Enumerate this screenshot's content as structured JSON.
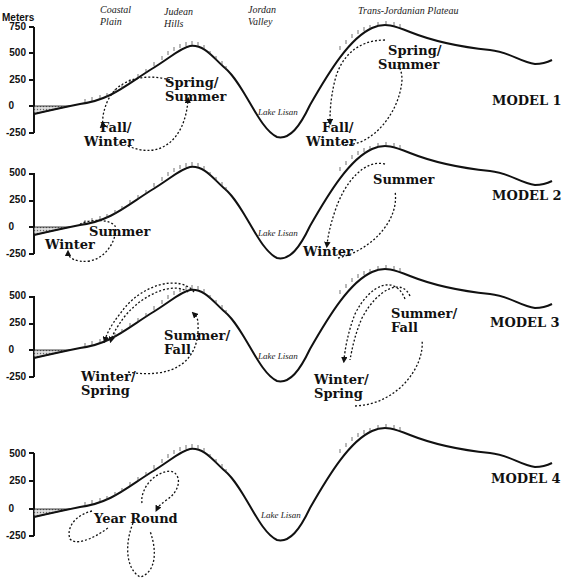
{
  "header": {
    "axis_title": "Meters",
    "regions": {
      "coastal_plain": [
        "Coastal",
        "Plain"
      ],
      "judean_hills": [
        "Judean",
        "Hills"
      ],
      "jordan_valley": [
        "Jordan",
        "Valley"
      ],
      "trans_jordanian": "Trans-Jordanian Plateau"
    }
  },
  "models": [
    {
      "label": "MODEL 1",
      "ticks": [
        "750",
        "500",
        "250",
        "0",
        "-250"
      ],
      "lake_label": "Lake Lisan",
      "seasons": [
        {
          "text": [
            "Spring/",
            "Summer"
          ],
          "side": "west"
        },
        {
          "text": [
            "Fall/",
            "Winter"
          ],
          "side": "west"
        },
        {
          "text": [
            "Spring/",
            "Summer"
          ],
          "side": "east"
        },
        {
          "text": [
            "Fall/",
            "Winter"
          ],
          "side": "east"
        }
      ]
    },
    {
      "label": "MODEL 2",
      "ticks": [
        "500",
        "250",
        "0",
        "-250"
      ],
      "lake_label": "Lake Lisan",
      "seasons": [
        {
          "text": [
            "Summer"
          ],
          "side": "west"
        },
        {
          "text": [
            "Winter"
          ],
          "side": "west"
        },
        {
          "text": [
            "Summer"
          ],
          "side": "east"
        },
        {
          "text": [
            "Winter"
          ],
          "side": "east"
        }
      ]
    },
    {
      "label": "MODEL 3",
      "ticks": [
        "500",
        "250",
        "0",
        "-250"
      ],
      "lake_label": "Lake Lisan",
      "seasons": [
        {
          "text": [
            "Summer/",
            "Fall"
          ],
          "side": "west"
        },
        {
          "text": [
            "Winter/",
            "Spring"
          ],
          "side": "west"
        },
        {
          "text": [
            "Summer/",
            "Fall"
          ],
          "side": "east"
        },
        {
          "text": [
            "Winter/",
            "Spring"
          ],
          "side": "east"
        }
      ]
    },
    {
      "label": "MODEL 4",
      "ticks": [
        "500",
        "250",
        "0",
        "-250"
      ],
      "lake_label": "Lake Lisan",
      "seasons": [
        {
          "text": [
            "Year Round"
          ],
          "side": "west"
        }
      ]
    }
  ],
  "colors": {
    "line": "#111111",
    "background": "#ffffff",
    "hatch": "#888888"
  }
}
